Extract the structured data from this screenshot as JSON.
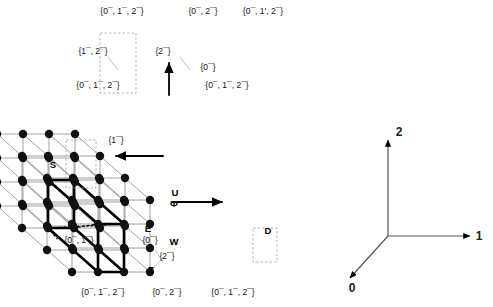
{
  "figure": {
    "colors": {
      "lattice_line": "#8a8a8a",
      "node": "#111111",
      "highlight": "#000000",
      "axis": "#555555",
      "background": "#ffffff"
    },
    "lattice": {
      "size": [
        4,
        4,
        4
      ],
      "projection": "oblique",
      "front_origin": [
        72,
        272
      ],
      "step_x": 78,
      "step_y": 72,
      "depth_dx": -25,
      "depth_dy": -22,
      "node_radius": 4.2
    },
    "vertex_labels": [
      {
        "id": "top-left",
        "text": "{0¯, 1¯, 2¯}",
        "x": 122,
        "y": 14,
        "anchor": "middle"
      },
      {
        "id": "top-mid",
        "text": "{0¯, 2¯}",
        "x": 203,
        "y": 14,
        "anchor": "middle"
      },
      {
        "id": "top-right",
        "text": "{0¯, 1', 2¯}",
        "x": 263,
        "y": 14,
        "anchor": "middle"
      },
      {
        "id": "upper-left-in",
        "text": "{1¯, 2¯}",
        "x": 93,
        "y": 54,
        "anchor": "middle"
      },
      {
        "id": "upper-mid-in",
        "text": "{2¯}",
        "x": 163,
        "y": 54,
        "anchor": "middle"
      },
      {
        "id": "upper-right-in",
        "text": "{0¯}",
        "x": 208,
        "y": 70,
        "anchor": "middle"
      },
      {
        "id": "mid-left",
        "text": "{0¯, 1¯, 2¯}",
        "x": 98,
        "y": 88,
        "anchor": "middle"
      },
      {
        "id": "mid-right",
        "text": "{0¯, 1¯, 2¯}",
        "x": 227,
        "y": 88,
        "anchor": "middle"
      },
      {
        "id": "inner-one",
        "text": "{1¯}",
        "x": 116,
        "y": 143,
        "anchor": "middle"
      },
      {
        "id": "lower-left",
        "text": "{0¯, 1¯}",
        "x": 79,
        "y": 243,
        "anchor": "middle"
      },
      {
        "id": "lower-e",
        "text": "{0¯}",
        "x": 150,
        "y": 243,
        "anchor": "middle"
      },
      {
        "id": "lower-w",
        "text": "{2¯}",
        "x": 167,
        "y": 259,
        "anchor": "middle"
      },
      {
        "id": "bottom-left",
        "text": "{0¯, 1¯, 2¯}",
        "x": 103,
        "y": 295,
        "anchor": "middle"
      },
      {
        "id": "bottom-mid",
        "text": "{0¯, 2¯}",
        "x": 167,
        "y": 295,
        "anchor": "middle"
      },
      {
        "id": "bottom-right",
        "text": "{0¯, 1¯, 2¯}",
        "x": 233,
        "y": 295,
        "anchor": "middle"
      }
    ],
    "markers": [
      {
        "id": "S",
        "text": "S",
        "x": 53,
        "y": 168
      },
      {
        "id": "U",
        "text": "U",
        "x": 175,
        "y": 196
      },
      {
        "id": "Phi",
        "text": "Φ",
        "x": 174,
        "y": 207
      },
      {
        "id": "E",
        "text": "E",
        "x": 148,
        "y": 232
      },
      {
        "id": "W",
        "text": "W",
        "x": 174,
        "y": 245
      },
      {
        "id": "Z",
        "text": "Z",
        "x": 151,
        "y": 273
      },
      {
        "id": "D",
        "text": "D",
        "x": 268,
        "y": 234
      }
    ],
    "axes": {
      "origin": [
        388,
        236
      ],
      "entries": [
        {
          "id": "axis-2",
          "label": "2",
          "end": [
            388,
            140
          ],
          "label_x": 399,
          "label_y": 136
        },
        {
          "id": "axis-1",
          "label": "1",
          "end": [
            470,
            236
          ],
          "label_x": 479,
          "label_y": 240
        },
        {
          "id": "axis-0",
          "label": "0",
          "end": [
            350,
            278
          ],
          "label_x": 352,
          "label_y": 292
        }
      ]
    }
  }
}
